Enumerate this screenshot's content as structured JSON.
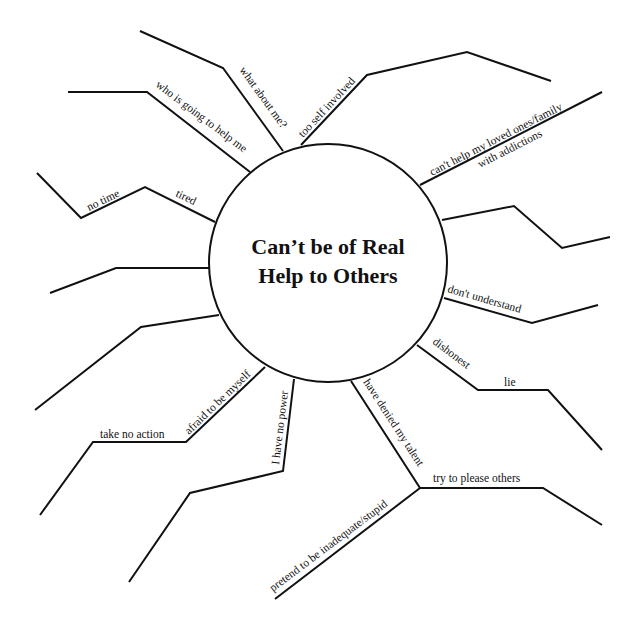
{
  "diagram": {
    "type": "mind-map / spider diagram",
    "center": {
      "title_line1": "Can’t be of Real",
      "title_line2": "Help to Others"
    },
    "colors": {
      "stroke": "#111111",
      "background": "#ffffff"
    },
    "branches": [
      {
        "id": "what-about-me",
        "labels": [
          "what about me?"
        ]
      },
      {
        "id": "too-self-involved",
        "labels": [
          "too self involved"
        ]
      },
      {
        "id": "cant-help-loved-ones",
        "labels": [
          "can't help my loved ones/family",
          "with addictions"
        ]
      },
      {
        "id": "right-upper-blank",
        "labels": []
      },
      {
        "id": "dont-understand",
        "labels": [
          "don't understand"
        ]
      },
      {
        "id": "dishonest-lie",
        "labels": [
          "dishonest",
          "lie"
        ]
      },
      {
        "id": "denied-talent",
        "labels": [
          "have denied my talent",
          "try to please others",
          "pretend to be inadequate/stupid"
        ]
      },
      {
        "id": "no-power",
        "labels": [
          "I have no power"
        ]
      },
      {
        "id": "afraid-myself",
        "labels": [
          "afraid to be myself",
          "take  no action"
        ]
      },
      {
        "id": "left-lower-blank",
        "labels": []
      },
      {
        "id": "left-middle-blank",
        "labels": []
      },
      {
        "id": "tired-no-time",
        "labels": [
          "tired",
          "no time"
        ]
      },
      {
        "id": "who-help-me",
        "labels": [
          "who is going to help me"
        ]
      }
    ]
  }
}
